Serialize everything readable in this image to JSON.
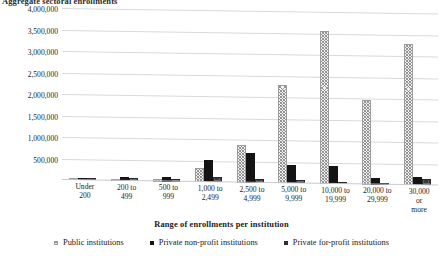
{
  "chart_data": {
    "type": "bar",
    "title": "Aggregate sectoral enrollments",
    "xlabel": "Range of enrollments per institution",
    "ylabel": "",
    "ylim": [
      0,
      4000000
    ],
    "grid": true,
    "legend_position": "bottom",
    "ytick_labels": [
      "4,000,000",
      "3,500,000",
      "3,000,000",
      "2,500,000",
      "2,000,000",
      "1,500,000",
      "1,000,000",
      "500,000"
    ],
    "ytick_values": [
      4000000,
      3500000,
      3000000,
      2500000,
      2000000,
      1500000,
      1000000,
      500000
    ],
    "categories": [
      "Under\n200",
      "200 to\n499",
      "500 to\n999",
      "1,000 to\n2,499",
      "2,500 to\n4,999",
      "5,000 to\n9,999",
      "10,000 to\n19,999",
      "20,000 to\n29,999",
      "30,000 or\nmore"
    ],
    "series": [
      {
        "name": "Public institutions",
        "values": [
          20000,
          40000,
          60000,
          330000,
          890000,
          2280000,
          3570000,
          1960000,
          3290000
        ]
      },
      {
        "name": "Private non-profit institutions",
        "values": [
          55000,
          95000,
          110000,
          510000,
          700000,
          420000,
          420000,
          150000,
          200000
        ]
      },
      {
        "name": "Private for-profit institutions",
        "values": [
          35000,
          65000,
          60000,
          110000,
          95000,
          75000,
          40000,
          30000,
          140000
        ]
      }
    ]
  }
}
